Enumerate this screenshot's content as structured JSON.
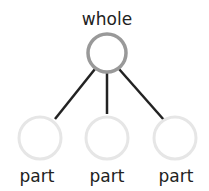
{
  "diagram": {
    "type": "part-whole",
    "whole": {
      "label": "whole",
      "value": ""
    },
    "parts": [
      {
        "label": "part",
        "value": ""
      },
      {
        "label": "part",
        "value": ""
      },
      {
        "label": "part",
        "value": ""
      }
    ],
    "colors": {
      "whole_stroke": "#999999",
      "part_stroke": "#e6e6e6",
      "connector": "#222222",
      "text": "#222222"
    }
  }
}
